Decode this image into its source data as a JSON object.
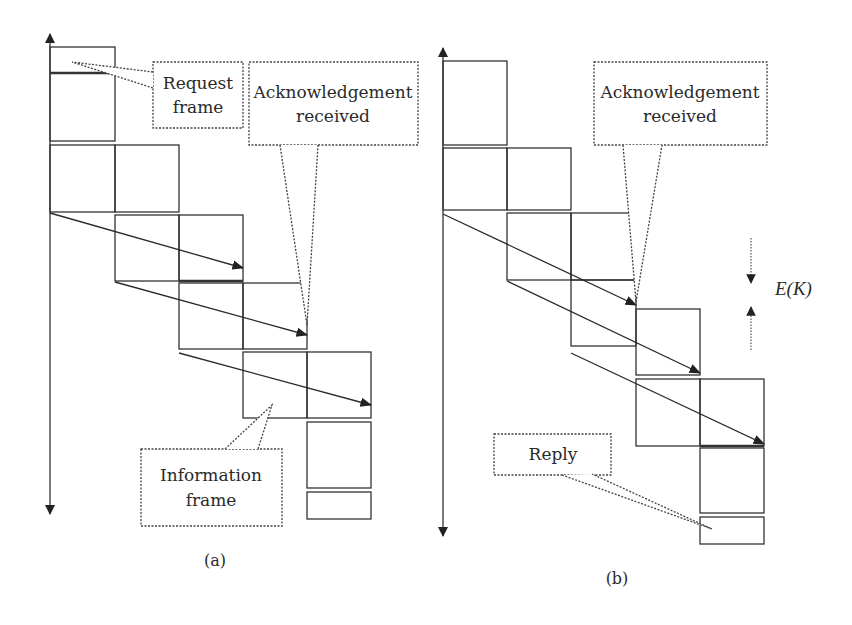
{
  "diagrams": [
    {
      "id": "a",
      "caption": "(a)",
      "caption_pos": [
        215,
        566
      ],
      "axis": {
        "x": 50,
        "y_top": 34,
        "y_bottom": 514
      },
      "frames": [
        {
          "x": 50,
          "y": 47,
          "w": 65,
          "h": 94
        },
        {
          "x": 50,
          "y": 145,
          "w": 65,
          "h": 67
        },
        {
          "x": 115,
          "y": 145,
          "w": 64,
          "h": 67
        },
        {
          "x": 115,
          "y": 215,
          "w": 64,
          "h": 66
        },
        {
          "x": 179,
          "y": 215,
          "w": 64,
          "h": 66
        },
        {
          "x": 179,
          "y": 283,
          "w": 64,
          "h": 66
        },
        {
          "x": 243,
          "y": 283,
          "w": 64,
          "h": 66
        },
        {
          "x": 243,
          "y": 352,
          "w": 64,
          "h": 66
        },
        {
          "x": 307,
          "y": 352,
          "w": 64,
          "h": 66
        },
        {
          "x": 307,
          "y": 422,
          "w": 64,
          "h": 66
        },
        {
          "x": 307,
          "y": 492,
          "w": 64,
          "h": 27
        }
      ],
      "thick_lines": [
        {
          "x1": 50,
          "y1": 73,
          "x2": 115,
          "y2": 73
        },
        {
          "x1": 179,
          "y1": 281,
          "x2": 243,
          "y2": 281
        }
      ],
      "arrows": [
        {
          "x1": 50,
          "y1": 213,
          "x2": 243,
          "y2": 268
        },
        {
          "x1": 115,
          "y1": 282,
          "x2": 307,
          "y2": 335
        },
        {
          "x1": 179,
          "y1": 353,
          "x2": 371,
          "y2": 405
        }
      ],
      "callouts": [
        {
          "name": "request-frame-callout",
          "box": {
            "x": 153,
            "y": 62,
            "w": 90,
            "h": 66
          },
          "tail": [
            [
              153,
              72
            ],
            [
              72,
              62
            ],
            [
              153,
              88
            ]
          ],
          "lines": [
            "Request",
            "frame"
          ],
          "text_x": 198,
          "text_y": [
            89,
            113
          ]
        },
        {
          "name": "acknowledgement-received-callout",
          "box": {
            "x": 249,
            "y": 62,
            "w": 169,
            "h": 83
          },
          "tail": [
            [
              280,
              145
            ],
            [
              307,
              325
            ],
            [
              318,
              145
            ]
          ],
          "lines": [
            "Acknowledgement",
            "received"
          ],
          "text_x": 333,
          "text_y": [
            98,
            122
          ]
        },
        {
          "name": "information-frame-callout",
          "box": {
            "x": 141,
            "y": 449,
            "w": 141,
            "h": 77
          },
          "tail": [
            [
              225,
              449
            ],
            [
              272,
              405
            ],
            [
              258,
              449
            ]
          ],
          "lines": [
            "Information",
            "frame"
          ],
          "text_x": 211,
          "text_y": [
            481,
            506
          ]
        }
      ]
    },
    {
      "id": "b",
      "caption": "(b)",
      "caption_pos": [
        617,
        584
      ],
      "axis": {
        "x": 443,
        "y_top": 48,
        "y_bottom": 536
      },
      "frames": [
        {
          "x": 443,
          "y": 61,
          "w": 64,
          "h": 84
        },
        {
          "x": 443,
          "y": 148,
          "w": 64,
          "h": 62
        },
        {
          "x": 507,
          "y": 148,
          "w": 64,
          "h": 62
        },
        {
          "x": 507,
          "y": 213,
          "w": 64,
          "h": 67
        },
        {
          "x": 571,
          "y": 213,
          "w": 65,
          "h": 67
        },
        {
          "x": 571,
          "y": 280,
          "w": 65,
          "h": 66
        },
        {
          "x": 636,
          "y": 309,
          "w": 64,
          "h": 66
        },
        {
          "x": 636,
          "y": 379,
          "w": 64,
          "h": 67
        },
        {
          "x": 700,
          "y": 379,
          "w": 64,
          "h": 67
        },
        {
          "x": 700,
          "y": 448,
          "w": 64,
          "h": 65
        },
        {
          "x": 700,
          "y": 517,
          "w": 64,
          "h": 27
        }
      ],
      "thick_lines": [
        {
          "x1": 700,
          "y1": 446,
          "x2": 764,
          "y2": 446
        }
      ],
      "arrows": [
        {
          "x1": 443,
          "y1": 214,
          "x2": 636,
          "y2": 305
        },
        {
          "x1": 507,
          "y1": 281,
          "x2": 700,
          "y2": 373
        },
        {
          "x1": 571,
          "y1": 353,
          "x2": 764,
          "y2": 444
        }
      ],
      "callouts": [
        {
          "name": "acknowledgement-received-callout",
          "box": {
            "x": 594,
            "y": 62,
            "w": 173,
            "h": 83
          },
          "tail": [
            [
              623,
              145
            ],
            [
              636,
              302
            ],
            [
              662,
              145
            ]
          ],
          "lines": [
            "Acknowledgement",
            "received"
          ],
          "text_x": 680,
          "text_y": [
            98,
            122
          ]
        },
        {
          "name": "reply-callout",
          "box": {
            "x": 494,
            "y": 434,
            "w": 117,
            "h": 41
          },
          "tail": [
            [
              562,
              475
            ],
            [
              712,
              529
            ],
            [
              592,
              474
            ]
          ],
          "lines": [
            "Reply"
          ],
          "text_x": 553,
          "text_y": [
            460
          ]
        }
      ],
      "interval_marker": {
        "label": "E(K)",
        "label_pos": [
          775,
          295
        ],
        "x": 751,
        "down_arrow": {
          "y1": 238,
          "y2": 283
        },
        "up_arrow": {
          "y1": 350,
          "y2": 307
        }
      }
    }
  ]
}
